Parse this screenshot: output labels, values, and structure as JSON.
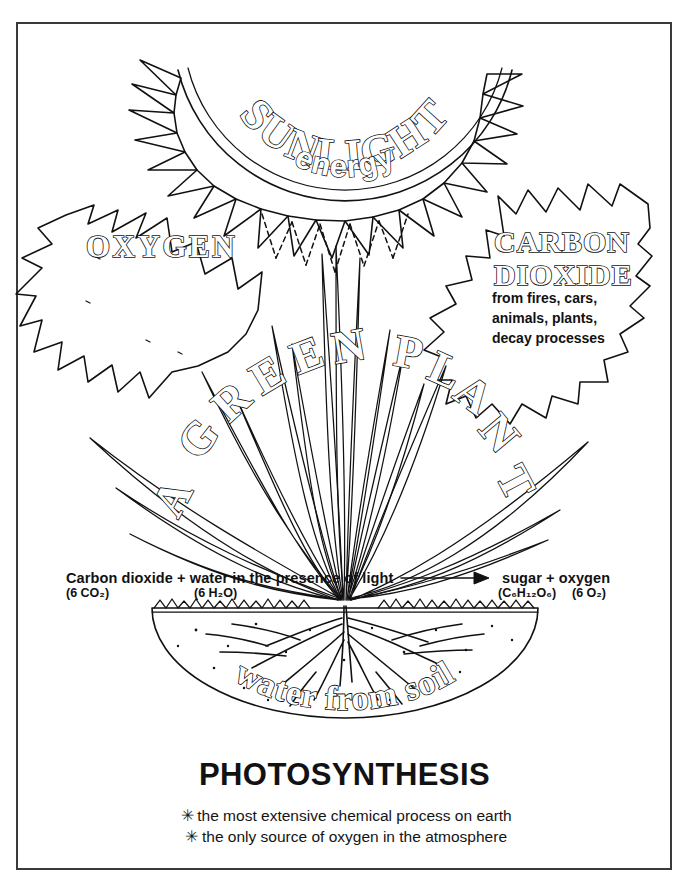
{
  "document": {
    "title": "PHOTOSYNTHESIS",
    "kind": "educational-diagram",
    "background_color": "#ffffff",
    "ink_color": "#111111",
    "frame_color": "#3a3a3a"
  },
  "sun": {
    "label_primary": "SUNLIGHT",
    "label_secondary": "energy",
    "ray_count": 20,
    "dotted_ray_count": 7
  },
  "oxygen_arrow": {
    "label": "OXYGEN",
    "direction": "up-left"
  },
  "carbon_dioxide_arrow": {
    "label_line1": "CARBON",
    "label_line2": "DIOXIDE",
    "note_line1": "from fires, cars,",
    "note_line2": "animals, plants,",
    "note_line3": "decay processes",
    "direction": "down-left"
  },
  "plant": {
    "arc_label": "A GREEN PLANT",
    "arc_letters": [
      "A",
      "G",
      "R",
      "E",
      "E",
      "N",
      "P",
      "L",
      "A",
      "N",
      "T"
    ],
    "leaf_count": 17
  },
  "soil": {
    "label": "water from soil"
  },
  "equation": {
    "reactants_text": "Carbon dioxide + water in the presence of light",
    "reactant_1_formula": "(6 CO₂)",
    "reactant_2_formula": "(6 H₂O)",
    "arrow": "⟶",
    "products_text": "sugar + oxygen",
    "product_1_formula": "(C₆H₁₂O₆)",
    "product_2_formula": "(6 O₂)"
  },
  "footer": {
    "heading": "PHOTOSYNTHESIS",
    "bullet_marker": "✳",
    "bullets": [
      "the most extensive chemical process on earth",
      "the only source of oxygen in the atmosphere"
    ]
  }
}
